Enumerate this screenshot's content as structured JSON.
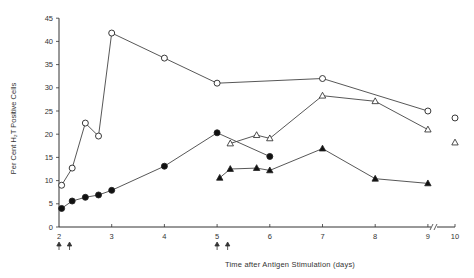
{
  "chart_data": {
    "type": "line",
    "title": "",
    "xlabel": "Time after Antigen Stimulation (days)",
    "ylabel": "Per Cent H₂T Positive Cells",
    "xlim": [
      2,
      10
    ],
    "ylim": [
      0,
      45
    ],
    "x_ticks": [
      "2",
      "3",
      "4",
      "5",
      "6",
      "7",
      "8",
      "9",
      "10"
    ],
    "y_ticks": [
      "0",
      "5",
      "10",
      "15",
      "20",
      "25",
      "30",
      "35",
      "40",
      "45"
    ],
    "grid": false,
    "legend": "none",
    "axis_break": "between 9 and 10",
    "series": [
      {
        "name": "open-circles",
        "marker": "open-circle",
        "points": [
          [
            2.05,
            9
          ],
          [
            2.25,
            12.7
          ],
          [
            2.5,
            22.4
          ],
          [
            2.75,
            19.6
          ],
          [
            3.0,
            41.8
          ],
          [
            4.0,
            36.4
          ],
          [
            5.0,
            31.0
          ],
          [
            7.0,
            32.0
          ],
          [
            9.0,
            25.0
          ]
        ],
        "isolated": [
          [
            10,
            23.5
          ]
        ]
      },
      {
        "name": "filled-circles",
        "marker": "filled-circle",
        "points": [
          [
            2.05,
            4.0
          ],
          [
            2.25,
            5.6
          ],
          [
            2.5,
            6.4
          ],
          [
            2.75,
            6.9
          ],
          [
            3.0,
            7.9
          ],
          [
            4.0,
            13.1
          ],
          [
            5.0,
            20.3
          ],
          [
            6.0,
            15.2
          ]
        ]
      },
      {
        "name": "open-triangles",
        "marker": "open-triangle",
        "points": [
          [
            5.25,
            18.0
          ],
          [
            5.75,
            19.8
          ],
          [
            6.0,
            19.1
          ],
          [
            7.0,
            28.3
          ],
          [
            8.0,
            27.1
          ],
          [
            9.0,
            21.0
          ]
        ],
        "isolated": [
          [
            10,
            18.2
          ]
        ]
      },
      {
        "name": "filled-triangles",
        "marker": "filled-triangle",
        "points": [
          [
            5.05,
            10.6
          ],
          [
            5.25,
            12.5
          ],
          [
            5.75,
            12.7
          ],
          [
            6.0,
            12.2
          ],
          [
            7.0,
            16.9
          ],
          [
            8.0,
            10.4
          ],
          [
            9.0,
            9.4
          ]
        ]
      }
    ],
    "annotations": [
      {
        "type": "arrow-up",
        "x": 2.0
      },
      {
        "type": "arrow-up",
        "x": 2.2
      },
      {
        "type": "arrow-up",
        "x": 5.0
      },
      {
        "type": "arrow-up",
        "x": 5.2
      }
    ]
  },
  "labels": {
    "xlabel": "Time after Antigen Stimulation (days)",
    "ylabel": "Per Cent H₂T Positive Cells"
  }
}
